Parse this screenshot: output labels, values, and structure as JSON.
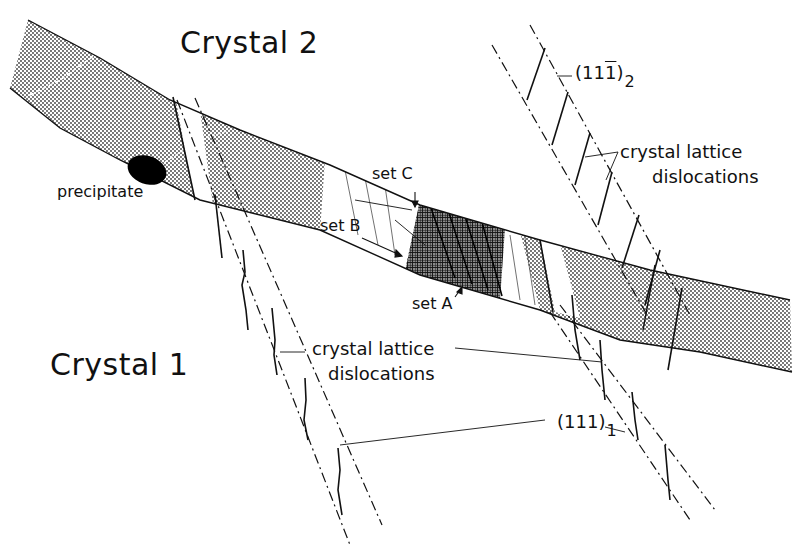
{
  "figure": {
    "type": "schematic diagram",
    "colors": {
      "ink": "#111111",
      "background": "#ffffff",
      "stipple": "#555555",
      "precipitate": "#000000"
    }
  },
  "labels": {
    "crystal2": "Crystal 2",
    "crystal1": "Crystal 1",
    "precipitate": "precipitate",
    "set_a": "set A",
    "set_b": "set B",
    "set_c": "set C",
    "dislocations_upper_line1": "crystal lattice",
    "dislocations_upper_line2": "dislocations",
    "dislocations_lower_line1": "crystal lattice",
    "dislocations_lower_line2": "dislocations",
    "plane2_prefix": "(11",
    "plane2_bar": "1",
    "plane2_suffix": ")",
    "plane2_sub": "2",
    "plane1_main": "(111)",
    "plane1_sub": "1"
  },
  "elements": {
    "grain_boundary": "stippled band crossing from upper-left to right",
    "precipitate_particle": "black ellipse at boundary near left",
    "cross_hatched_region": "dense dislocation network where sets A, B, C intersect",
    "slip_planes_crystal2": "(11-1)2 dash-dot plane traces, upper right",
    "slip_planes_crystal1": "(111)1 dash-dot plane traces, lower"
  }
}
